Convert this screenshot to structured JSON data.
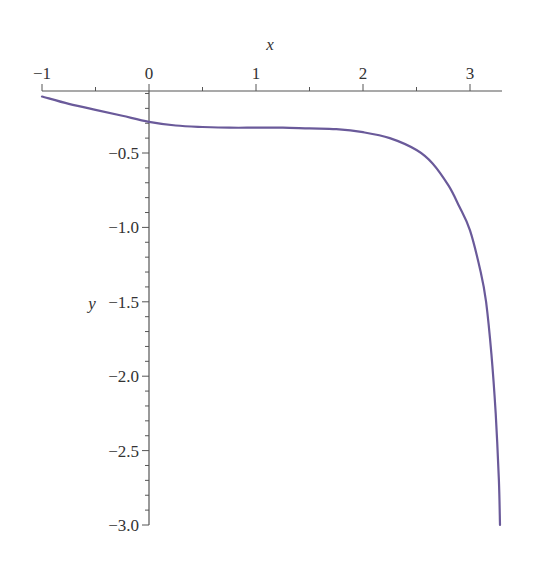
{
  "chart_data": {
    "type": "line",
    "title": "",
    "xlabel": "x",
    "ylabel": "y",
    "xlim": [
      -1,
      3.28
    ],
    "ylim": [
      -3.0,
      -0.08
    ],
    "grid": false,
    "legend": null,
    "x_axis_position": "top",
    "x_ticks": [
      -1,
      0,
      1,
      2,
      3
    ],
    "x_tick_labels": [
      "−1",
      "0",
      "1",
      "2",
      "3"
    ],
    "y_ticks": [
      -0.5,
      -1.0,
      -1.5,
      -2.0,
      -2.5,
      -3.0
    ],
    "y_tick_labels": [
      "−0.5",
      "−1.0",
      "−1.5",
      "−2.0",
      "−2.5",
      "−3.0"
    ],
    "series": [
      {
        "name": "y(x)",
        "color": "#6a5a9a",
        "x": [
          -1.0,
          -0.75,
          -0.5,
          -0.25,
          0.0,
          0.25,
          0.5,
          0.75,
          1.0,
          1.25,
          1.5,
          1.75,
          2.0,
          2.25,
          2.5,
          2.65,
          2.8,
          2.9,
          3.0,
          3.1,
          3.15,
          3.2,
          3.24,
          3.27,
          3.28
        ],
        "y": [
          -0.12,
          -0.17,
          -0.21,
          -0.25,
          -0.29,
          -0.315,
          -0.325,
          -0.33,
          -0.33,
          -0.33,
          -0.335,
          -0.34,
          -0.36,
          -0.4,
          -0.48,
          -0.57,
          -0.72,
          -0.86,
          -1.02,
          -1.3,
          -1.5,
          -1.85,
          -2.25,
          -2.7,
          -3.0
        ]
      }
    ]
  },
  "layout": {
    "plot_left_px": 42,
    "px_per_x": 107,
    "y_zero_px": 78.6,
    "px_per_y": 148.8,
    "x_axis_y_px": 91,
    "y_axis_x_px": 149,
    "x_axis_right_px": 502
  }
}
